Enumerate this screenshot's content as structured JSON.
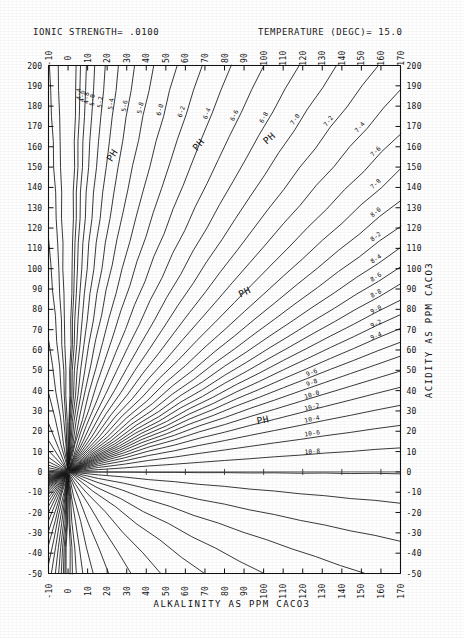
{
  "header": {
    "ionic_strength_text": "IONIC STRENGTH= .0100",
    "temperature_text": "TEMPERATURE (DEGC)= 15.0"
  },
  "axes": {
    "x_title": "ALKALINITY AS PPM CACO3",
    "y_title": "ACIDITY AS PPM CACO3"
  },
  "annotations": {
    "ph_caption": "PH"
  },
  "chart_data": {
    "type": "line",
    "title": "",
    "subtitle": "IONIC STRENGTH= .0100    TEMPERATURE (DEGC)= 15.0",
    "xlabel": "ALKALINITY AS PPM CACO3",
    "ylabel": "ACIDITY AS PPM CACO3",
    "xlim": [
      -10,
      170
    ],
    "ylim": [
      -50,
      200
    ],
    "xticks": [
      -10,
      0,
      10,
      20,
      30,
      40,
      50,
      60,
      70,
      80,
      90,
      100,
      110,
      120,
      130,
      140,
      150,
      160,
      170
    ],
    "yticks": [
      -50,
      -40,
      -30,
      -20,
      -10,
      0,
      10,
      20,
      30,
      40,
      50,
      60,
      70,
      80,
      90,
      100,
      110,
      120,
      130,
      140,
      150,
      160,
      170,
      180,
      190,
      200
    ],
    "xtick_labels": [
      "-10",
      "0",
      "10",
      "20",
      "30",
      "40",
      "50",
      "60",
      "70",
      "80",
      "90",
      "100",
      "110",
      "120",
      "130",
      "140",
      "150",
      "160",
      "170"
    ],
    "ytick_labels": [
      "-50",
      "-40",
      "-30",
      "-20",
      "-10",
      "0",
      "10",
      "20",
      "30",
      "40",
      "50",
      "60",
      "70",
      "80",
      "90",
      "100",
      "110",
      "120",
      "130",
      "140",
      "150",
      "160",
      "170",
      "180",
      "190",
      "200"
    ],
    "grid": false,
    "legend": "none",
    "axes_duplicated": {
      "top_x_axis": true,
      "right_y_axis": true
    },
    "note": "Deffeyes / Caldwell-Lawrence water-chemistry diagram. Each line is a constant-pH locus radiating from the origin (alkalinity=0, acidity=0). Lines are labelled with the pH value written with a hyphen for the decimal point, e.g. 9-6 means pH 9.6. Steep lines are low pH; shallow lines are high pH.",
    "series": [
      {
        "name": "4-4",
        "ph": 4.4,
        "slope": 48.0,
        "label": "4-4",
        "label_x": 6.5,
        "label_y": 186
      },
      {
        "name": "4-6",
        "ph": 4.6,
        "slope": 31.0,
        "label": "4-6",
        "label_x": 8.2,
        "label_y": 185
      },
      {
        "name": "4-8",
        "ph": 4.8,
        "slope": 21.0,
        "label": "4-8",
        "label_x": 10.5,
        "label_y": 184
      },
      {
        "name": "5-0",
        "ph": 5.0,
        "slope": 14.5,
        "label": "5-0",
        "label_x": 13.5,
        "label_y": 183
      },
      {
        "name": "5-2",
        "ph": 5.2,
        "slope": 10.4,
        "label": "5-2",
        "label_x": 17.5,
        "label_y": 182
      },
      {
        "name": "5-4",
        "ph": 5.4,
        "slope": 7.7,
        "label": "5-4",
        "label_x": 23.0,
        "label_y": 181
      },
      {
        "name": "5-6",
        "ph": 5.6,
        "slope": 5.85,
        "label": "5-6",
        "label_x": 30.0,
        "label_y": 180
      },
      {
        "name": "5-8",
        "ph": 5.8,
        "slope": 4.55,
        "label": "5-8",
        "label_x": 38.0,
        "label_y": 179
      },
      {
        "name": "6-0",
        "ph": 6.0,
        "slope": 3.6,
        "label": "6-0",
        "label_x": 48.0,
        "label_y": 178
      },
      {
        "name": "6-2",
        "ph": 6.2,
        "slope": 2.92,
        "label": "6-2",
        "label_x": 59.0,
        "label_y": 177
      },
      {
        "name": "6-4",
        "ph": 6.4,
        "slope": 2.4,
        "label": "6-4",
        "label_x": 72.0,
        "label_y": 176
      },
      {
        "name": "6-6",
        "ph": 6.6,
        "slope": 2.0,
        "label": "6-6",
        "label_x": 86.0,
        "label_y": 175
      },
      {
        "name": "6-8",
        "ph": 6.8,
        "slope": 1.695,
        "label": "6-8",
        "label_x": 101.0,
        "label_y": 174
      },
      {
        "name": "7-0",
        "ph": 7.0,
        "slope": 1.455,
        "label": "7-0",
        "label_x": 117.0,
        "label_y": 173
      },
      {
        "name": "7-2",
        "ph": 7.2,
        "slope": 1.262,
        "label": "7-2",
        "label_x": 134.0,
        "label_y": 172
      },
      {
        "name": "7-4",
        "ph": 7.4,
        "slope": 1.108,
        "label": "7-4",
        "label_x": 150.0,
        "label_y": 169
      },
      {
        "name": "7-6",
        "ph": 7.6,
        "slope": 0.98,
        "label": "7-6",
        "label_x": 158.0,
        "label_y": 157
      },
      {
        "name": "7-8",
        "ph": 7.8,
        "slope": 0.875,
        "label": "7-8",
        "label_x": 158.0,
        "label_y": 141
      },
      {
        "name": "8-0",
        "ph": 8.0,
        "slope": 0.787,
        "label": "8-0",
        "label_x": 158.0,
        "label_y": 127
      },
      {
        "name": "8-2",
        "ph": 8.2,
        "slope": 0.712,
        "label": "8-2",
        "label_x": 158.0,
        "label_y": 115
      },
      {
        "name": "8-4",
        "ph": 8.4,
        "slope": 0.648,
        "label": "8-4",
        "label_x": 158.0,
        "label_y": 104
      },
      {
        "name": "8-6",
        "ph": 8.6,
        "slope": 0.592,
        "label": "8-6",
        "label_x": 158.0,
        "label_y": 95
      },
      {
        "name": "8-8",
        "ph": 8.8,
        "slope": 0.543,
        "label": "8-8",
        "label_x": 158.0,
        "label_y": 87
      },
      {
        "name": "9-0",
        "ph": 9.0,
        "slope": 0.498,
        "label": "9-0",
        "label_x": 158.0,
        "label_y": 79
      },
      {
        "name": "9-2",
        "ph": 9.2,
        "slope": 0.456,
        "label": "9-2",
        "label_x": 158.0,
        "label_y": 72
      },
      {
        "name": "9-4",
        "ph": 9.4,
        "slope": 0.416,
        "label": "9-4",
        "label_x": 158.0,
        "label_y": 66
      },
      {
        "name": "9-6",
        "ph": 9.6,
        "slope": 0.376,
        "label": "9-6",
        "label_x": 125.0,
        "label_y": 48
      },
      {
        "name": "9-8",
        "ph": 9.8,
        "slope": 0.335,
        "label": "9-8",
        "label_x": 125.0,
        "label_y": 43
      },
      {
        "name": "10-0",
        "ph": 10.0,
        "slope": 0.292,
        "label": "10-0",
        "label_x": 125.0,
        "label_y": 37
      },
      {
        "name": "10-2",
        "ph": 10.2,
        "slope": 0.245,
        "label": "10-2",
        "label_x": 125.0,
        "label_y": 31
      },
      {
        "name": "10-4",
        "ph": 10.4,
        "slope": 0.193,
        "label": "10-4",
        "label_x": 125.0,
        "label_y": 25
      },
      {
        "name": "10-6",
        "ph": 10.6,
        "slope": 0.135,
        "label": "10-6",
        "label_x": 125.0,
        "label_y": 18
      },
      {
        "name": "10-8",
        "ph": 10.8,
        "slope": 0.07,
        "label": "10-8",
        "label_x": 125.0,
        "label_y": 9
      },
      {
        "name": "11-0",
        "ph": 11.0,
        "slope": -0.005,
        "label": "",
        "label_x": 0,
        "label_y": 0
      },
      {
        "name": "11-2",
        "ph": 11.2,
        "slope": -0.09,
        "label": "",
        "label_x": 0,
        "label_y": 0
      },
      {
        "name": "11-4",
        "ph": 11.4,
        "slope": -0.2,
        "label": "",
        "label_x": 0,
        "label_y": 0
      },
      {
        "name": "11-6",
        "ph": 11.6,
        "slope": -0.33,
        "label": "",
        "label_x": 0,
        "label_y": 0
      },
      {
        "name": "11-8",
        "ph": 11.8,
        "slope": -0.5,
        "label": "",
        "label_x": 0,
        "label_y": 0
      },
      {
        "name": "12-0",
        "ph": 12.0,
        "slope": -0.72,
        "label": "",
        "label_x": 0,
        "label_y": 0
      },
      {
        "name": "12-2",
        "ph": 12.2,
        "slope": -1.05,
        "label": "",
        "label_x": 0,
        "label_y": 0
      },
      {
        "name": "12-4",
        "ph": 12.4,
        "slope": -1.55,
        "label": "",
        "label_x": 0,
        "label_y": 0
      },
      {
        "name": "12-6",
        "ph": 12.6,
        "slope": -2.4,
        "label": "",
        "label_x": 0,
        "label_y": 0
      },
      {
        "name": "12-8",
        "ph": 12.8,
        "slope": -3.9,
        "label": "",
        "label_x": 0,
        "label_y": 0
      },
      {
        "name": "13-0",
        "ph": 13.0,
        "slope": -6.5,
        "label": "",
        "label_x": 0,
        "label_y": 0
      },
      {
        "name": "13-2",
        "ph": 13.2,
        "slope": -11.5,
        "label": "",
        "label_x": 0,
        "label_y": 0
      },
      {
        "name": "13-4",
        "ph": 13.4,
        "slope": -21.0,
        "label": "",
        "label_x": 0,
        "label_y": 0
      },
      {
        "name": "13-6",
        "ph": 13.6,
        "slope": -40.0,
        "label": "",
        "label_x": 0,
        "label_y": 0
      }
    ],
    "ph_captions": [
      {
        "text": "PH",
        "x": 24,
        "y": 155,
        "rot": -58
      },
      {
        "text": "PH",
        "x": 68,
        "y": 160,
        "rot": -50
      },
      {
        "text": "PH",
        "x": 104,
        "y": 163,
        "rot": -42
      },
      {
        "text": "PH",
        "x": 91,
        "y": 87,
        "rot": -26
      },
      {
        "text": "PH",
        "x": 100,
        "y": 24,
        "rot": -12
      }
    ]
  }
}
